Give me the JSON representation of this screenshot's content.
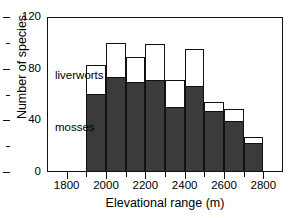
{
  "chart_data": {
    "type": "bar",
    "title": "",
    "xlabel": "Elevational range (m)",
    "ylabel": "Number of species",
    "xlim": [
      1700,
      2900
    ],
    "ylim": [
      0,
      120
    ],
    "grid": false,
    "legend_position": "in-plot annotations",
    "stacked": true,
    "bar_width_m": 100,
    "categories": [
      "1900-2000",
      "2000-2100",
      "2100-2200",
      "2200-2300",
      "2300-2400",
      "2400-2500",
      "2500-2600",
      "2600-2700",
      "2700-2800"
    ],
    "bin_starts": [
      1900,
      2000,
      2100,
      2200,
      2300,
      2400,
      2500,
      2600,
      2700
    ],
    "series": [
      {
        "name": "mosses",
        "color": "#3b3b3b",
        "values": [
          59,
          72,
          68,
          70,
          49,
          65,
          46,
          38,
          21
        ]
      },
      {
        "name": "liverworts",
        "color": "#ffffff",
        "values": [
          24,
          28,
          21,
          29,
          22,
          30,
          8,
          11,
          6
        ]
      }
    ],
    "totals": [
      83,
      100,
      89,
      99,
      71,
      95,
      54,
      49,
      27
    ],
    "yticks_major": [
      0,
      40,
      80,
      120
    ],
    "yticks_minor": [
      20,
      60,
      100
    ],
    "ytick_labels": [
      "0",
      "40",
      "80",
      "120"
    ],
    "xticks_major": [
      1800,
      2000,
      2200,
      2400,
      2600,
      2800
    ],
    "xticks_minor": [
      1900,
      2100,
      2300,
      2500,
      2700
    ],
    "xtick_labels": [
      "1800",
      "2000",
      "2200",
      "2400",
      "2600",
      "2800"
    ],
    "annotations": [
      {
        "text": "liverworts",
        "series": "liverworts"
      },
      {
        "text": "mosses",
        "series": "mosses"
      }
    ]
  }
}
